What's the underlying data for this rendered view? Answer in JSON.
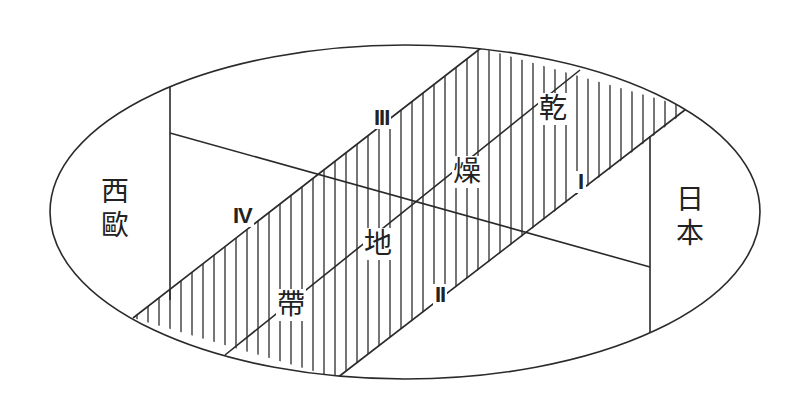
{
  "diagram": {
    "type": "schematic map of Eurasia",
    "regions": {
      "west_europe": [
        "西",
        "歐"
      ],
      "japan": [
        "日",
        "本"
      ]
    },
    "band_label": [
      "乾",
      "燥",
      "地",
      "帶"
    ],
    "band_label_full": "乾燥地帶",
    "zone_labels": {
      "I": "I",
      "II": "II",
      "III": "III",
      "IV": "IV"
    },
    "colors": {
      "line": "#2a2a2a",
      "text": "#222222",
      "background": "#ffffff"
    }
  }
}
